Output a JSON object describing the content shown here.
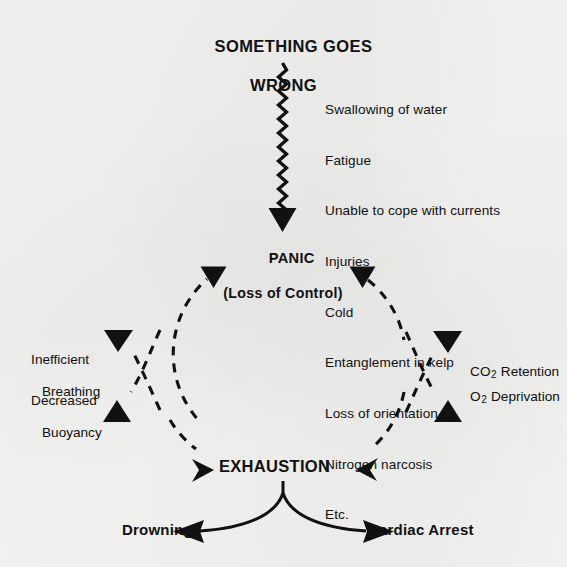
{
  "diagram": {
    "title": {
      "line1": "SOMETHING GOES",
      "line2": "WRONG"
    },
    "causes": {
      "items": [
        "Swallowing of water",
        "Fatigue",
        "Unable to cope with currents",
        "Injuries",
        "Cold",
        "Entanglement in kelp",
        "Loss of orientation",
        "Nitrogen narcosis",
        "Etc."
      ]
    },
    "panic": {
      "label": "PANIC",
      "sublabel": "(Loss of Control)"
    },
    "left_effects": {
      "breathing": {
        "line1": "Inefficient",
        "line2": "Breathing"
      },
      "buoyancy": {
        "line1": "Decreased",
        "line2": "Buoyancy"
      }
    },
    "right_effects": {
      "co2": {
        "molecule": "CO",
        "subscript": "2",
        "text": "Retention"
      },
      "o2": {
        "molecule": "O",
        "subscript": "2",
        "text": "Deprivation"
      }
    },
    "exhaustion": {
      "label": "EXHAUSTION"
    },
    "outcomes": {
      "left": "Drowning",
      "right": "Cardiac Arrest"
    },
    "style": {
      "ink_color": "#111111",
      "paper_color": "#f4f4f2"
    }
  }
}
